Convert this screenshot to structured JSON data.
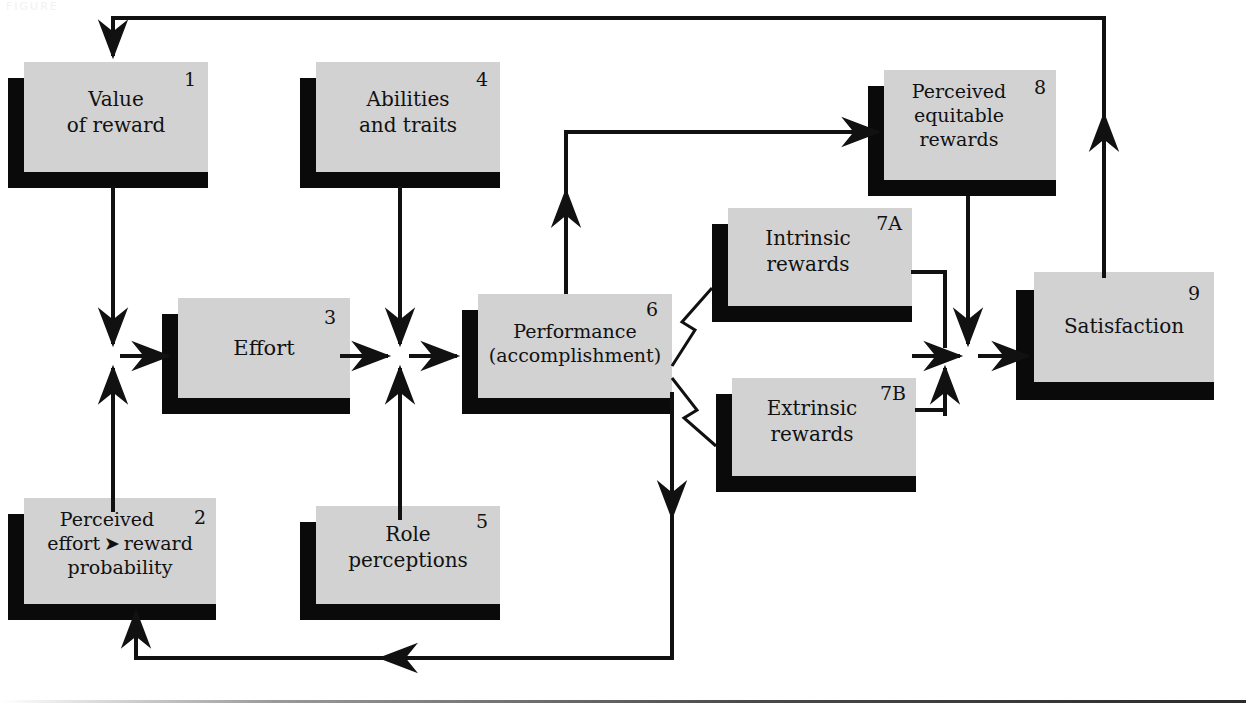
{
  "figure": {
    "title_fragment": "FIGURE",
    "box_fill": "#d2d2d2",
    "shadow_color": "#0a0a0a",
    "line_color": "#111111"
  },
  "nodes": [
    {
      "id": "1",
      "number": "1",
      "lines": [
        "Value",
        "of reward"
      ]
    },
    {
      "id": "2",
      "number": "2",
      "lines": [
        "Perceived",
        "effort ➤ reward",
        "probability"
      ]
    },
    {
      "id": "3",
      "number": "3",
      "lines": [
        "Effort"
      ]
    },
    {
      "id": "4",
      "number": "4",
      "lines": [
        "Abilities",
        "and traits"
      ]
    },
    {
      "id": "5",
      "number": "5",
      "lines": [
        "Role",
        "perceptions"
      ]
    },
    {
      "id": "6",
      "number": "6",
      "lines": [
        "Performance",
        "(accomplishment)"
      ]
    },
    {
      "id": "7A",
      "number": "7A",
      "lines": [
        "Intrinsic",
        "rewards"
      ]
    },
    {
      "id": "7B",
      "number": "7B",
      "lines": [
        "Extrinsic",
        "rewards"
      ]
    },
    {
      "id": "8",
      "number": "8",
      "lines": [
        "Perceived",
        "equitable",
        "rewards"
      ]
    },
    {
      "id": "9",
      "number": "9",
      "lines": [
        "Satisfaction"
      ]
    }
  ],
  "connections": [
    {
      "name": "satisfaction-to-value-of-reward",
      "from": "9",
      "to": "1",
      "style": "feedback-top"
    },
    {
      "name": "value-of-reward-to-effort-node",
      "from": "1",
      "to": "3",
      "style": "down-then-right"
    },
    {
      "name": "perceived-probability-to-effort-node",
      "from": "2",
      "to": "3",
      "style": "up-then-right"
    },
    {
      "name": "abilities-to-performance-node",
      "from": "4",
      "to": "6",
      "style": "down-then-right"
    },
    {
      "name": "role-perceptions-to-performance-node",
      "from": "5",
      "to": "6",
      "style": "up-then-right"
    },
    {
      "name": "effort-to-performance",
      "from": "3",
      "to": "6",
      "style": "right"
    },
    {
      "name": "performance-to-perceived-equitable-rewards",
      "from": "6",
      "to": "8",
      "style": "up-then-right"
    },
    {
      "name": "performance-to-intrinsic-rewards",
      "from": "6",
      "to": "7A",
      "style": "zigzag-up"
    },
    {
      "name": "performance-to-extrinsic-rewards",
      "from": "6",
      "to": "7B",
      "style": "zigzag-down"
    },
    {
      "name": "intrinsic-rewards-to-satisfaction-node",
      "from": "7A",
      "to": "9",
      "style": "right-then-down"
    },
    {
      "name": "extrinsic-rewards-to-satisfaction-node",
      "from": "7B",
      "to": "9",
      "style": "right-then-up"
    },
    {
      "name": "perceived-equitable-rewards-to-satisfaction-node",
      "from": "8",
      "to": "9",
      "style": "down"
    },
    {
      "name": "performance-to-perceived-probability-feedback",
      "from": "6",
      "to": "2",
      "style": "feedback-bottom"
    }
  ]
}
